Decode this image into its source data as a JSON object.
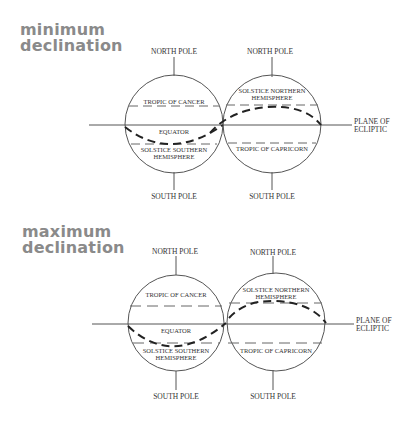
{
  "panels": [
    {
      "id": "minimum",
      "title_line1": "minimum",
      "title_line2": "declination",
      "left_globe": {
        "top_label": "NORTH POLE",
        "bottom_label": "SOUTH POLE",
        "upper_band_label": "TROPIC OF CANCER",
        "equator_label": "EQUATOR",
        "lower_band_label_line1": "SOLSTICE SOUTHERN",
        "lower_band_label_line2": "HEMISPHERE"
      },
      "right_globe": {
        "top_label": "NORTH POLE",
        "bottom_label": "SOUTH POLE",
        "upper_band_label_line1": "SOLSTICE NORTHERN",
        "upper_band_label_line2": "HEMISPHERE",
        "lower_band_label": "TROPIC OF CAPRICORN"
      },
      "ecliptic_label_line1": "PLANE OF",
      "ecliptic_label_line2": "ECLIPTIC"
    },
    {
      "id": "maximum",
      "title_line1": "maximum",
      "title_line2": "declination",
      "left_globe": {
        "top_label": "NORTH POLE",
        "bottom_label": "SOUTH POLE",
        "upper_band_label": "TROPIC OF CANCER",
        "equator_label": "EQUATOR",
        "lower_band_label_line1": "SOLSTICE SOUTHERN",
        "lower_band_label_line2": "HEMISPHERE"
      },
      "right_globe": {
        "top_label": "NORTH POLE",
        "bottom_label": "SOUTH POLE",
        "upper_band_label_line1": "SOLSTICE NORTHERN",
        "upper_band_label_line2": "HEMISPHERE",
        "lower_band_label": "TROPIC OF CAPRICORN"
      },
      "ecliptic_label_line1": "PLANE OF",
      "ecliptic_label_line2": "ECLIPTIC"
    }
  ],
  "colors": {
    "title": "#8a8a8a",
    "line": "#555555",
    "dashed_path": "#222222",
    "label": "#333333"
  }
}
